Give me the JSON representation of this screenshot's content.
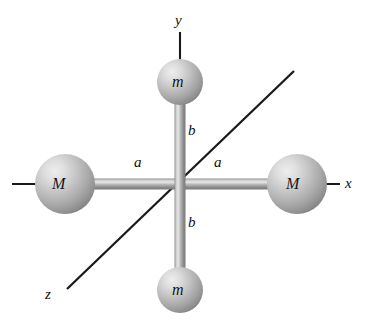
{
  "figure": {
    "background_color": "#ffffff",
    "width": 366,
    "height": 326
  },
  "colors": {
    "axis_line": "#1a1a1a",
    "rod_body": "#9a9a9a",
    "rod_highlight": "#e2e2e2",
    "rod_shadow": "#6e6e6e",
    "sphere_light": "#e8e8e8",
    "sphere_mid": "#b4b4b4",
    "sphere_dark": "#7d7d7d",
    "label_text": "#101010"
  },
  "axes": [
    {
      "id": "x-axis",
      "label": "x",
      "orientation": "horizontal",
      "label_position": {
        "x": 350,
        "y": 184
      }
    },
    {
      "id": "y-axis",
      "label": "y",
      "orientation": "vertical",
      "label_position": {
        "x": 180,
        "y": 22
      }
    },
    {
      "id": "z-axis",
      "label": "z",
      "orientation": "diagonal",
      "label_position": {
        "x": 50,
        "y": 295
      }
    }
  ],
  "masses": [
    {
      "id": "mass-m-top",
      "label": "m",
      "symbol": "m",
      "on_axis": "y",
      "side": "positive",
      "radius": 23,
      "center": {
        "x": 180,
        "y": 82
      }
    },
    {
      "id": "mass-m-bottom",
      "label": "m",
      "symbol": "m",
      "on_axis": "y",
      "side": "negative",
      "radius": 23,
      "center": {
        "x": 180,
        "y": 290
      }
    },
    {
      "id": "mass-M-left",
      "label": "M",
      "symbol": "M",
      "on_axis": "x",
      "side": "negative",
      "radius": 30,
      "center": {
        "x": 65,
        "y": 184
      }
    },
    {
      "id": "mass-M-right",
      "label": "M",
      "symbol": "M",
      "on_axis": "x",
      "side": "positive",
      "radius": 30,
      "center": {
        "x": 297,
        "y": 184
      }
    }
  ],
  "dimensions": [
    {
      "id": "distance-a-left",
      "label": "a",
      "describes": "center to left mass M along x",
      "position": {
        "x": 140,
        "y": 163
      }
    },
    {
      "id": "distance-a-right",
      "label": "a",
      "describes": "center to right mass M along x",
      "position": {
        "x": 220,
        "y": 163
      }
    },
    {
      "id": "distance-b-top",
      "label": "b",
      "describes": "center to top mass m along y",
      "position": {
        "x": 192,
        "y": 131
      }
    },
    {
      "id": "distance-b-bottom",
      "label": "b",
      "describes": "center to bottom mass m along y",
      "position": {
        "x": 192,
        "y": 223
      }
    }
  ],
  "center": {
    "x": 180,
    "y": 184
  }
}
